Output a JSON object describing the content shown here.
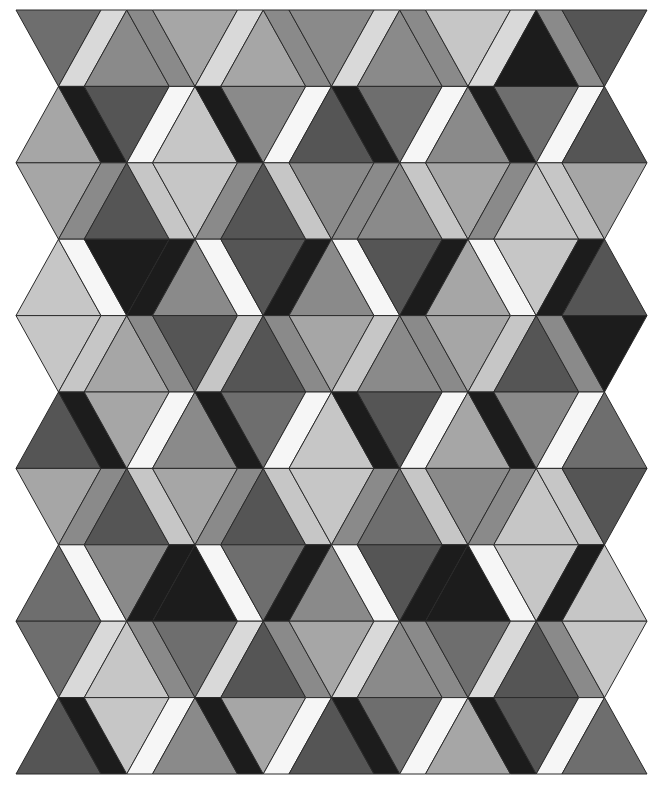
{
  "artwork": {
    "type": "geometric-tessellation",
    "description": "Rows of alternating up/down triangles separated by slanted parallelogram strips, grayscale",
    "geometry": {
      "left": 16,
      "top": 10,
      "row_height": 76.4,
      "triangle_base": 85,
      "strip_width": 25.75,
      "rows": 10,
      "triangles_per_row": 9
    },
    "palette": {
      "K": "#1c1c1c",
      "D": "#555555",
      "E": "#6e6e6e",
      "M": "#8a8a8a",
      "A": "#a6a6a6",
      "L": "#c6c6c6",
      "V": "#d9d9d9",
      "W": "#f6f6f6"
    },
    "rows": [
      {
        "first": "down",
        "fills": [
          "E",
          "V",
          "M",
          "M",
          "A",
          "V",
          "A",
          "M",
          "M",
          "V",
          "M",
          "M",
          "L",
          "V",
          "K",
          "M",
          "D"
        ]
      },
      {
        "first": "up",
        "fills": [
          "A",
          "K",
          "D",
          "W",
          "L",
          "K",
          "M",
          "W",
          "D",
          "K",
          "E",
          "W",
          "M",
          "K",
          "E",
          "W",
          "D"
        ]
      },
      {
        "first": "down",
        "fills": [
          "A",
          "M",
          "D",
          "L",
          "L",
          "M",
          "D",
          "L",
          "M",
          "M",
          "M",
          "L",
          "A",
          "M",
          "L",
          "L",
          "A"
        ]
      },
      {
        "first": "up",
        "fills": [
          "L",
          "W",
          "K",
          "K",
          "M",
          "W",
          "D",
          "K",
          "M",
          "W",
          "D",
          "K",
          "A",
          "W",
          "L",
          "K",
          "D"
        ]
      },
      {
        "first": "down",
        "fills": [
          "L",
          "L",
          "A",
          "M",
          "D",
          "L",
          "D",
          "M",
          "A",
          "L",
          "M",
          "M",
          "A",
          "L",
          "D",
          "M",
          "K"
        ]
      },
      {
        "first": "up",
        "fills": [
          "D",
          "K",
          "A",
          "W",
          "M",
          "K",
          "E",
          "W",
          "L",
          "K",
          "D",
          "W",
          "A",
          "K",
          "M",
          "W",
          "E"
        ]
      },
      {
        "first": "down",
        "fills": [
          "A",
          "M",
          "D",
          "L",
          "A",
          "M",
          "D",
          "L",
          "L",
          "M",
          "E",
          "L",
          "M",
          "M",
          "L",
          "L",
          "D"
        ]
      },
      {
        "first": "up",
        "fills": [
          "E",
          "W",
          "M",
          "K",
          "K",
          "W",
          "E",
          "K",
          "M",
          "W",
          "D",
          "K",
          "K",
          "W",
          "L",
          "K",
          "L"
        ]
      },
      {
        "first": "down",
        "fills": [
          "E",
          "V",
          "L",
          "M",
          "E",
          "V",
          "D",
          "M",
          "A",
          "V",
          "M",
          "M",
          "E",
          "V",
          "D",
          "M",
          "L"
        ]
      },
      {
        "first": "up",
        "fills": [
          "D",
          "K",
          "L",
          "W",
          "M",
          "K",
          "A",
          "W",
          "D",
          "K",
          "E",
          "W",
          "A",
          "K",
          "D",
          "W",
          "E"
        ]
      }
    ]
  }
}
